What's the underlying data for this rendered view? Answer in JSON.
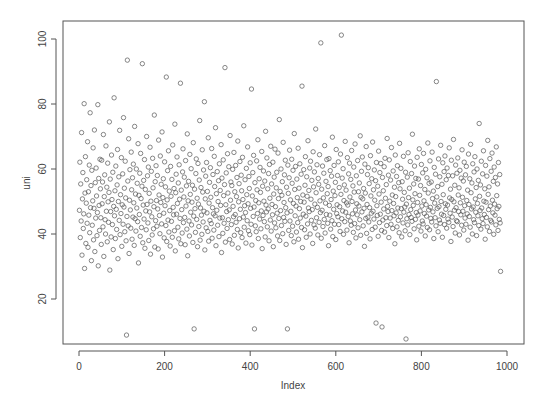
{
  "chart_data": {
    "type": "scatter",
    "title": "",
    "xlabel": "Index",
    "ylabel": "uni",
    "xlim": [
      0,
      1000
    ],
    "ylim": [
      5,
      104
    ],
    "x_ticks": [
      0,
      200,
      400,
      600,
      800,
      1000
    ],
    "y_ticks": [
      20,
      40,
      60,
      80,
      100
    ],
    "grid": false,
    "legend": "none",
    "marker": "open-circle",
    "marker_color": "#555555",
    "n_points": 1000,
    "x": "index 1..1000",
    "y": [
      47.3,
      62.1,
      38.9,
      55.4,
      44.0,
      71.2,
      33.5,
      50.8,
      58.9,
      41.7,
      46.2,
      80.1,
      29.4,
      52.6,
      63.8,
      37.1,
      49.5,
      56.7,
      43.3,
      68.4,
      35.9,
      53.0,
      45.8,
      61.2,
      40.4,
      77.3,
      48.1,
      54.9,
      31.8,
      59.6,
      42.7,
      50.2,
      66.5,
      38.2,
      47.9,
      72.0,
      34.6,
      55.8,
      44.9,
      60.3,
      51.7,
      39.5,
      46.6,
      79.8,
      30.2,
      57.1,
      48.8,
      41.1,
      63.0,
      53.9,
      45.0,
      36.8,
      62.7,
      49.3,
      56.0,
      42.2,
      70.6,
      33.1,
      51.5,
      58.2,
      44.4,
      40.0,
      67.1,
      47.0,
      54.4,
      37.6,
      61.8,
      49.9,
      43.6,
      52.8,
      74.5,
      28.9,
      56.9,
      46.9,
      39.1,
      64.3,
      50.6,
      42.9,
      59.0,
      35.2,
      48.5,
      81.9,
      45.6,
      53.3,
      38.6,
      60.9,
      47.6,
      41.4,
      55.1,
      66.0,
      32.4,
      50.0,
      57.6,
      44.2,
      71.9,
      39.8,
      52.1,
      46.3,
      63.5,
      36.2,
      49.0,
      58.5,
      43.0,
      75.8,
      48.3,
      54.1,
      40.7,
      62.4,
      51.1,
      37.9,
      8.9,
      45.4,
      93.5,
      56.3,
      42.5,
      69.3,
      34.0,
      50.4,
      59.8,
      47.4,
      41.8,
      65.2,
      53.6,
      38.4,
      57.3,
      45.2,
      61.5,
      49.6,
      36.5,
      73.1,
      44.7,
      52.3,
      40.9,
      60.0,
      48.0,
      55.6,
      43.8,
      67.8,
      31.1,
      51.9,
      46.0,
      58.7,
      39.3,
      64.8,
      50.9,
      42.0,
      54.7,
      92.4,
      37.3,
      48.9,
      56.5,
      44.6,
      62.9,
      35.6,
      53.7,
      47.1,
      41.3,
      70.0,
      49.1,
      57.9,
      43.4,
      60.6,
      38.0,
      52.5,
      46.8,
      66.7,
      33.8,
      50.1,
      59.3,
      45.3,
      39.7,
      63.3,
      54.2,
      41.6,
      48.4,
      76.6,
      36.0,
      56.1,
      44.1,
      61.0,
      50.3,
      42.4,
      58.0,
      47.7,
      35.4,
      68.9,
      52.0,
      45.7,
      40.1,
      64.0,
      49.7,
      55.3,
      43.1,
      71.4,
      32.9,
      51.2,
      57.0,
      46.4,
      38.8,
      62.2,
      48.7,
      54.5,
      42.6,
      88.3,
      37.7,
      50.5,
      59.5,
      44.3,
      65.6,
      40.6,
      53.2,
      47.2,
      36.3,
      60.8,
      51.6,
      43.9,
      56.8,
      39.0,
      67.4,
      48.2,
      45.9,
      54.0,
      41.0,
      73.8,
      34.8,
      52.7,
      58.4,
      46.1,
      63.7,
      49.4,
      42.1,
      55.7,
      38.5,
      61.3,
      50.7,
      44.8,
      86.4,
      37.0,
      53.5,
      47.5,
      40.3,
      59.1,
      66.2,
      43.5,
      51.4,
      57.5,
      45.1,
      36.7,
      62.6,
      48.6,
      54.8,
      41.5,
      70.8,
      33.3,
      50.2,
      56.2,
      44.0,
      39.4,
      64.5,
      52.2,
      46.7,
      60.1,
      42.8,
      49.8,
      55.0,
      37.4,
      68.1,
      45.5,
      10.8,
      53.8,
      47.8,
      40.5,
      58.6,
      63.1,
      44.5,
      51.0,
      36.1,
      61.7,
      49.2,
      42.3,
      56.6,
      74.9,
      38.1,
      48.0,
      54.3,
      45.8,
      39.9,
      65.9,
      52.9,
      43.7,
      59.7,
      47.0,
      80.7,
      35.1,
      50.8,
      57.8,
      41.9,
      62.0,
      46.5,
      53.1,
      40.8,
      69.6,
      37.8,
      49.5,
      55.9,
      44.2,
      60.4,
      51.3,
      43.2,
      66.3,
      38.7,
      48.1,
      58.3,
      46.2,
      41.2,
      63.9,
      54.6,
      45.6,
      72.7,
      36.4,
      52.4,
      47.3,
      59.2,
      42.7,
      50.0,
      56.4,
      39.2,
      61.6,
      44.9,
      53.4,
      48.8,
      67.5,
      34.3,
      57.2,
      45.0,
      40.2,
      62.8,
      51.8,
      43.3,
      55.2,
      91.2,
      37.5,
      49.0,
      58.8,
      46.9,
      41.7,
      64.7,
      52.6,
      44.4,
      60.7,
      47.4,
      38.3,
      70.3,
      50.4,
      56.0,
      42.9,
      54.9,
      36.9,
      59.9,
      48.5,
      45.3,
      65.1,
      39.6,
      53.0,
      46.0,
      61.1,
      43.6,
      51.5,
      57.4,
      41.4,
      68.6,
      35.7,
      49.9,
      55.5,
      44.7,
      62.3,
      47.6,
      40.4,
      58.1,
      53.3,
      38.9,
      63.6,
      50.6,
      45.2,
      73.3,
      42.1,
      48.7,
      56.7,
      46.6,
      37.2,
      60.2,
      52.1,
      44.1,
      66.8,
      49.3,
      41.0,
      57.7,
      54.0,
      39.8,
      61.9,
      47.9,
      43.0,
      84.6,
      36.6,
      51.7,
      58.9,
      45.4,
      64.2,
      48.3,
      10.8,
      55.8,
      42.5,
      50.3,
      40.7,
      62.5,
      53.6,
      46.3,
      69.0,
      38.6,
      49.6,
      57.0,
      44.6,
      60.5,
      52.8,
      41.6,
      47.1,
      65.4,
      35.5,
      54.7,
      45.7,
      59.4,
      50.1,
      43.8,
      56.3,
      39.1,
      71.6,
      48.9,
      46.8,
      63.4,
      42.2,
      53.9,
      47.7,
      58.6,
      37.9,
      61.4,
      51.0,
      44.3,
      67.0,
      40.9,
      55.4,
      49.1,
      45.9,
      62.1,
      36.1,
      52.3,
      57.5,
      43.4,
      66.1,
      48.4,
      41.9,
      54.2,
      59.0,
      46.4,
      39.4,
      64.9,
      50.9,
      44.8,
      75.2,
      38.0,
      53.1,
      47.2,
      60.0,
      42.6,
      51.9,
      56.1,
      40.1,
      68.2,
      45.1,
      49.7,
      58.2,
      43.9,
      62.7,
      48.1,
      36.8,
      54.4,
      46.5,
      10.8,
      61.2,
      52.5,
      41.1,
      57.3,
      65.8,
      44.0,
      50.5,
      47.0,
      39.5,
      63.0,
      55.6,
      42.4,
      59.6,
      49.4,
      37.6,
      70.9,
      53.7,
      45.6,
      60.8,
      48.6,
      40.6,
      56.9,
      51.2,
      43.5,
      66.4,
      38.4,
      54.1,
      47.8,
      61.6,
      44.9,
      50.0,
      58.4,
      42.0,
      85.5,
      35.8,
      52.0,
      46.1,
      59.8,
      49.8,
      41.3,
      55.0,
      63.8,
      45.5,
      39.0,
      57.6,
      51.6,
      43.1,
      68.7,
      48.0,
      53.4,
      46.9,
      60.3,
      40.0,
      62.4,
      50.7,
      44.2,
      56.5,
      47.5,
      37.1,
      65.3,
      54.5,
      42.8,
      59.1,
      49.2,
      41.8,
      72.3,
      52.7,
      45.0,
      61.3,
      48.2,
      39.7,
      57.1,
      55.3,
      43.6,
      64.4,
      50.2,
      46.6,
      98.8,
      38.7,
      53.8,
      47.3,
      60.9,
      42.3,
      51.1,
      58.7,
      44.5,
      67.2,
      40.3,
      49.5,
      56.2,
      46.0,
      62.9,
      52.4,
      43.3,
      54.6,
      36.4,
      63.2,
      48.8,
      45.8,
      59.5,
      41.5,
      50.6,
      57.8,
      44.1,
      69.8,
      39.2,
      53.2,
      47.6,
      61.1,
      43.0,
      51.8,
      55.9,
      38.3,
      66.0,
      46.3,
      49.0,
      58.0,
      45.3,
      62.2,
      42.9,
      54.3,
      48.4,
      40.8,
      64.6,
      52.2,
      101.2,
      44.7,
      57.2,
      47.1,
      60.1,
      39.9,
      50.3,
      55.1,
      43.8,
      68.5,
      46.7,
      53.5,
      49.6,
      41.2,
      63.5,
      48.9,
      45.4,
      58.5,
      37.3,
      61.8,
      51.4,
      44.0,
      56.8,
      42.7,
      65.7,
      50.0,
      46.2,
      54.8,
      40.5,
      60.6,
      52.9,
      43.2,
      67.7,
      47.4,
      38.8,
      57.9,
      49.3,
      45.9,
      62.6,
      41.9,
      53.0,
      48.6,
      55.7,
      44.4,
      70.2,
      39.6,
      51.3,
      59.3,
      46.8,
      63.7,
      50.8,
      42.5,
      54.0,
      47.9,
      36.2,
      61.5,
      52.6,
      44.8,
      66.9,
      40.2,
      49.1,
      58.3,
      45.2,
      60.4,
      43.7,
      55.5,
      48.1,
      38.5,
      64.1,
      51.7,
      46.4,
      57.0,
      41.4,
      68.3,
      47.0,
      53.6,
      44.6,
      59.7,
      50.4,
      42.1,
      56.4,
      12.6,
      62.0,
      48.7,
      45.7,
      54.7,
      39.3,
      65.5,
      52.3,
      43.5,
      58.9,
      46.1,
      61.7,
      49.8,
      41.1,
      11.4,
      57.4,
      44.3,
      53.3,
      47.7,
      60.7,
      40.6,
      63.3,
      51.0,
      45.0,
      55.2,
      42.6,
      69.4,
      48.5,
      46.9,
      58.1,
      38.9,
      62.8,
      50.1,
      44.9,
      56.6,
      43.0,
      66.6,
      47.2,
      52.0,
      41.7,
      59.4,
      49.4,
      45.6,
      54.4,
      37.0,
      64.3,
      51.5,
      46.5,
      57.7,
      42.2,
      61.0,
      48.0,
      44.2,
      55.8,
      40.4,
      67.9,
      53.9,
      45.3,
      60.2,
      47.8,
      39.1,
      56.1,
      50.7,
      43.4,
      63.9,
      46.7,
      52.8,
      48.3,
      41.0,
      59.0,
      7.7,
      49.2,
      44.7,
      57.5,
      42.8,
      65.0,
      51.2,
      46.0,
      54.1,
      39.8,
      62.3,
      47.5,
      45.1,
      58.6,
      43.9,
      70.7,
      50.5,
      48.8,
      55.4,
      41.6,
      60.9,
      52.4,
      44.5,
      57.1,
      46.6,
      38.2,
      63.6,
      49.7,
      45.8,
      56.9,
      42.4,
      66.2,
      51.9,
      47.1,
      54.9,
      40.9,
      61.4,
      48.6,
      44.0,
      58.8,
      43.1,
      64.8,
      50.2,
      46.3,
      53.7,
      39.4,
      59.9,
      49.0,
      45.5,
      57.3,
      42.0,
      68.0,
      52.6,
      47.4,
      55.6,
      41.3,
      62.5,
      48.2,
      44.8,
      56.0,
      43.7,
      65.2,
      50.9,
      46.8,
      53.2,
      38.6,
      60.5,
      49.5,
      45.0,
      58.4,
      42.5,
      86.9,
      51.4,
      47.9,
      54.6,
      40.7,
      63.1,
      48.4,
      44.3,
      57.6,
      43.3,
      67.3,
      50.0,
      46.1,
      55.3,
      39.0,
      61.9,
      52.1,
      45.7,
      59.2,
      42.9,
      64.0,
      49.3,
      47.6,
      56.7,
      41.8,
      60.3,
      48.9,
      44.6,
      58.0,
      43.6,
      66.5,
      51.1,
      46.4,
      53.8,
      37.7,
      62.7,
      50.6,
      45.2,
      57.9,
      42.3,
      69.1,
      49.9,
      47.3,
      55.0,
      40.3,
      61.2,
      48.1,
      44.1,
      58.7,
      43.8,
      63.4,
      52.0,
      46.9,
      54.2,
      39.7,
      59.6,
      49.6,
      45.9,
      57.2,
      42.7,
      65.9,
      51.3,
      47.0,
      56.3,
      41.2,
      62.1,
      48.7,
      44.9,
      58.2,
      43.0,
      60.8,
      50.3,
      46.2,
      53.5,
      38.1,
      64.6,
      49.1,
      45.4,
      57.0,
      42.1,
      67.6,
      52.7,
      47.7,
      55.7,
      40.0,
      61.6,
      48.3,
      44.4,
      59.1,
      43.5,
      63.8,
      50.8,
      46.7,
      54.3,
      39.5,
      60.0,
      49.4,
      45.6,
      56.5,
      42.6,
      74.0,
      51.6,
      47.2,
      55.1,
      41.5,
      62.4,
      48.0,
      44.7,
      58.5,
      43.2,
      65.6,
      50.1,
      46.0,
      53.9,
      38.4,
      61.1,
      49.8,
      45.1,
      57.8,
      42.2,
      68.8,
      52.2,
      47.5,
      54.5,
      40.8,
      63.2,
      48.6,
      44.2,
      59.3,
      43.7,
      64.9,
      50.4,
      46.5,
      56.2,
      39.9,
      60.6,
      49.2,
      45.8,
      57.4,
      42.8,
      66.8,
      51.8,
      47.8,
      55.4,
      41.1,
      62.0,
      48.5,
      44.5,
      58.3,
      43.4,
      28.5
    ]
  }
}
